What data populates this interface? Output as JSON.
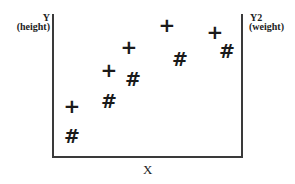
{
  "chart_data": {
    "type": "scatter",
    "title": "",
    "xlabel": "X",
    "ylabel": "Y (height)",
    "y2label": "Y2 (weight)",
    "grid": false,
    "legend": null,
    "series": [
      {
        "name": "height",
        "axis": "left",
        "marker": "+",
        "points": [
          {
            "x": 1,
            "y": 3
          },
          {
            "x": 3,
            "y": 5.5
          },
          {
            "x": 4,
            "y": 7.2
          },
          {
            "x": 6,
            "y": 8.8
          },
          {
            "x": 8.5,
            "y": 8.3
          }
        ]
      },
      {
        "name": "weight",
        "axis": "right",
        "marker": "#",
        "points": [
          {
            "x": 1,
            "y": 1
          },
          {
            "x": 3,
            "y": 3.2
          },
          {
            "x": 4.2,
            "y": 5.5
          },
          {
            "x": 6.7,
            "y": 6.9
          },
          {
            "x": 9.1,
            "y": 7.6
          }
        ]
      }
    ]
  },
  "labels": {
    "y_title": "Y",
    "y_sub": "(height)",
    "y2_title": "Y2",
    "y2_sub": "(weight)",
    "x_title": "X"
  },
  "markers": {
    "plus": "+",
    "hash": "#"
  },
  "plot_pixels": {
    "plus": [
      [
        72,
        106
      ],
      [
        109,
        70
      ],
      [
        129,
        47
      ],
      [
        167,
        25
      ],
      [
        215,
        32
      ]
    ],
    "hash": [
      [
        72,
        136
      ],
      [
        109,
        101
      ],
      [
        133,
        79
      ],
      [
        180,
        59
      ],
      [
        227,
        51
      ]
    ]
  }
}
